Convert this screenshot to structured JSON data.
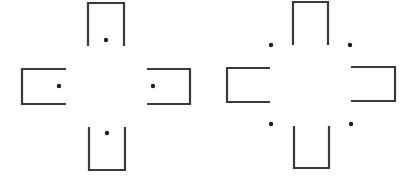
{
  "figures": [
    {
      "name": "left-figure",
      "brackets": [
        {
          "name": "top-u",
          "path": "M 88 46 L 88 3 L 124 3 L 124 46"
        },
        {
          "name": "left-bracket",
          "path": "M 66 69 L 22 69 L 22 104 L 66 104"
        },
        {
          "name": "right-bracket",
          "path": "M 147 69 L 190 69 L 190 104 L 147 104"
        },
        {
          "name": "bottom-u",
          "path": "M 89 127 L 89 170 L 125 170 L 125 127"
        }
      ],
      "dots": [
        {
          "name": "dot-top",
          "cx": 106,
          "cy": 40
        },
        {
          "name": "dot-left",
          "cx": 59,
          "cy": 86
        },
        {
          "name": "dot-right",
          "cx": 153,
          "cy": 86
        },
        {
          "name": "dot-bottom",
          "cx": 107,
          "cy": 133
        }
      ]
    },
    {
      "name": "right-figure",
      "brackets": [
        {
          "name": "top-u",
          "path": "M 293 45 L 293 2 L 328 2 L 328 45"
        },
        {
          "name": "left-bracket",
          "path": "M 270 68 L 227 68 L 227 102 L 270 102"
        },
        {
          "name": "right-bracket",
          "path": "M 351 67 L 395 67 L 395 101 L 351 101"
        },
        {
          "name": "bottom-u",
          "path": "M 294 126 L 294 168 L 329 168 L 329 126"
        }
      ],
      "dots": [
        {
          "name": "dot-top-left",
          "cx": 271,
          "cy": 45
        },
        {
          "name": "dot-top-right",
          "cx": 350,
          "cy": 45
        },
        {
          "name": "dot-bottom-left",
          "cx": 271,
          "cy": 124
        },
        {
          "name": "dot-bottom-right",
          "cx": 351,
          "cy": 124
        }
      ]
    }
  ],
  "style": {
    "stroke_color": "#3a3a3a",
    "dot_color": "#1e1e1e",
    "background": "#ffffff",
    "dot_radius": 2.2
  }
}
